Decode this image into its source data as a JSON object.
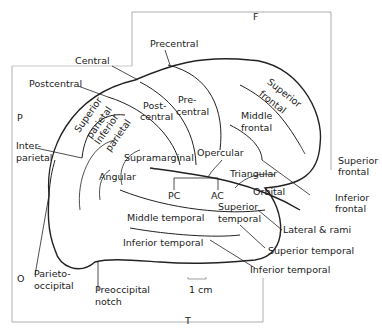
{
  "frame_letters": {
    "frontal": "F",
    "parietal": "P",
    "occipital": "O",
    "temporal": "T"
  },
  "sulci_labels": {
    "precentral": "Precentral",
    "central": "Central",
    "postcentral": "Postcentral",
    "interparietal_1": "Inter-",
    "interparietal_2": "parietal",
    "superior_frontal_1": "Superior",
    "superior_frontal_2": "frontal",
    "inferior_frontal_1": "Inferior",
    "inferior_frontal_2": "frontal",
    "lateral_rami": "Lateral & rami",
    "superior_temporal": "Superior temporal",
    "inferior_temporal": "Inferior temporal",
    "parieto_occipital_1": "Parieto-",
    "parieto_occipital_2": "occipital",
    "preoccipital_1": "Preoccipital",
    "preoccipital_2": "notch"
  },
  "gyri_labels": {
    "superior_parietal_1": "Superior",
    "superior_parietal_2": "parietal",
    "inferior_parietal_1": "Inferior",
    "inferior_parietal_2": "parietal",
    "postcentral_1": "Post-",
    "postcentral_2": "central",
    "precentral_1": "Pre-",
    "precentral_2": "central",
    "superior_frontal_1": "Superior",
    "superior_frontal_2": "frontal",
    "middle_frontal_1": "Middle",
    "middle_frontal_2": "frontal",
    "supramarginal": "Supramarginal",
    "opercular": "Opercular",
    "angular": "Angular",
    "triangular": "Triangular",
    "orbital": "Orbital",
    "pc": "PC",
    "ac": "AC",
    "superior_temporal_1": "Superior",
    "superior_temporal_2": "temporal",
    "middle_temporal": "Middle temporal",
    "inferior_temporal": "Inferior temporal"
  },
  "scale_bar": "1 cm"
}
